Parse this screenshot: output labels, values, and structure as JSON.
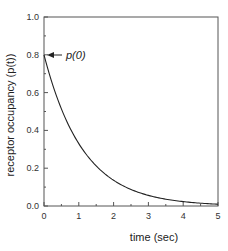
{
  "chart_data": {
    "type": "line",
    "title": "",
    "xlabel": "time (sec)",
    "ylabel": "receptor occupancy (p(t))",
    "xlim": [
      0,
      5
    ],
    "ylim": [
      0.0,
      1.0
    ],
    "x_ticks": [
      "0",
      "1",
      "2",
      "3",
      "4",
      "5"
    ],
    "y_ticks": [
      "0.0",
      "0.2",
      "0.4",
      "0.6",
      "0.8",
      "1.0"
    ],
    "grid": false,
    "legend": null,
    "series": [
      {
        "name": "p(t)",
        "x": [
          0,
          0.25,
          0.5,
          0.75,
          1.0,
          1.5,
          2.0,
          2.5,
          3.0,
          3.5,
          4.0,
          4.5,
          5.0
        ],
        "values": [
          0.8,
          0.64,
          0.51,
          0.41,
          0.33,
          0.21,
          0.13,
          0.08,
          0.05,
          0.03,
          0.02,
          0.01,
          0.01
        ],
        "color": "#222222"
      }
    ],
    "annotations": [
      {
        "text": "p(0)",
        "x": 0,
        "y": 0.8,
        "arrow": "left"
      }
    ]
  }
}
